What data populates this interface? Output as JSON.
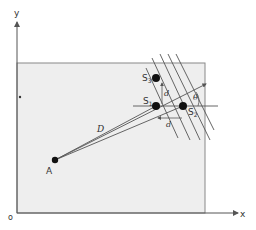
{
  "diagram": {
    "axes": {
      "x_label": "x",
      "y_label": "y",
      "origin_label": "o"
    },
    "points": {
      "A": {
        "label": "A"
      },
      "S1": {
        "label": "S",
        "sub": "1"
      },
      "S2": {
        "label": "S",
        "sub": "2"
      },
      "S3": {
        "label": "S",
        "sub": "3"
      }
    },
    "annotations": {
      "distance_D": "D",
      "spacing_d_vertical": "d",
      "spacing_d_horizontal": "d",
      "angle_theta": "θ"
    },
    "colors": {
      "region_fill": "#eeeeee",
      "line": "#555555",
      "point": "#111111"
    }
  }
}
